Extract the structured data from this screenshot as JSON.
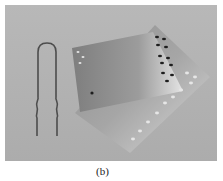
{
  "figure": {
    "caption": "(b)",
    "photo_description": "Photograph of a bent U-shaped wire with wavy ends next to two overlapping perforated metal plates on a gray background",
    "colors": {
      "background": "#b4b4b4",
      "plate_light": "#d6d6d6",
      "plate_mid": "#a9a9a9",
      "wire": "#555555"
    }
  }
}
